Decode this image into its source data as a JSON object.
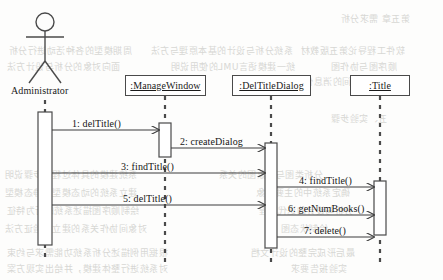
{
  "diagram": {
    "kind": "uml-sequence-diagram",
    "width": 443,
    "height": 280,
    "line_color": "#4a4a4a",
    "text_color": "#1a1a1a",
    "background": "#fdfdfc"
  },
  "actor": {
    "name": "Administrator",
    "icon": "stick-figure-actor",
    "x": 45,
    "head_cy": 22,
    "head_r": 9,
    "lifeline_top": 100,
    "lifeline_bottom": 262,
    "activation": {
      "x": 38,
      "y": 112,
      "w": 14,
      "h": 133
    }
  },
  "lifelines": [
    {
      "id": "managewindow",
      "label": ":ManageWindow",
      "box": {
        "x": 125,
        "y": 75,
        "w": 81,
        "h": 21
      },
      "center_x": 165,
      "lifeline_top": 96,
      "lifeline_bottom": 262,
      "activations": [
        {
          "x": 159,
          "y": 123,
          "w": 12,
          "h": 34
        }
      ]
    },
    {
      "id": "deltitledialog",
      "label": ":DelTitleDialog",
      "box": {
        "x": 232,
        "y": 75,
        "w": 79,
        "h": 21
      },
      "center_x": 271,
      "lifeline_top": 96,
      "lifeline_bottom": 262,
      "activations": [
        {
          "x": 265,
          "y": 143,
          "w": 12,
          "h": 105
        }
      ]
    },
    {
      "id": "title",
      "label": ":Title",
      "box": {
        "x": 350,
        "y": 75,
        "w": 60,
        "h": 21
      },
      "center_x": 380,
      "lifeline_top": 96,
      "lifeline_bottom": 262,
      "activations": [
        {
          "x": 374,
          "y": 181,
          "w": 12,
          "h": 54
        }
      ]
    }
  ],
  "messages": [
    {
      "seq": "1",
      "label": "1: delTitle()",
      "from": "actor",
      "to": "managewindow",
      "x1": 52,
      "x2": 159,
      "y": 130,
      "label_x": 72,
      "label_y": 118,
      "arrow": "solid-open"
    },
    {
      "seq": "2",
      "label": "2: createDialog",
      "from": "managewindow",
      "to": "deltitledialog",
      "x1": 171,
      "x2": 265,
      "y": 148,
      "label_x": 180,
      "label_y": 136,
      "arrow": "solid-open"
    },
    {
      "seq": "3",
      "label": "3: findTitle()",
      "from": "actor",
      "to": "deltitledialog",
      "x1": 52,
      "x2": 265,
      "y": 173,
      "label_x": 121,
      "label_y": 161,
      "arrow": "solid-open"
    },
    {
      "seq": "4",
      "label": "4: findTitle()",
      "from": "deltitledialog",
      "to": "title",
      "x1": 277,
      "x2": 374,
      "y": 187,
      "label_x": 299,
      "label_y": 175,
      "arrow": "solid-open"
    },
    {
      "seq": "5",
      "label": "5: delTitle()",
      "from": "actor",
      "to": "deltitledialog",
      "x1": 52,
      "x2": 265,
      "y": 205,
      "label_x": 123,
      "label_y": 193,
      "arrow": "solid-open"
    },
    {
      "seq": "6",
      "label": "6: getNumBooks()",
      "from": "deltitledialog",
      "to": "title",
      "x1": 277,
      "x2": 374,
      "y": 215,
      "label_x": 288,
      "label_y": 203,
      "arrow": "solid-open"
    },
    {
      "seq": "7",
      "label": "7: delete()",
      "from": "deltitledialog",
      "to": "title",
      "x1": 277,
      "x2": 374,
      "y": 237,
      "label_x": 304,
      "label_y": 225,
      "arrow": "solid-open"
    }
  ],
  "bleed_text": [
    {
      "text": "周期模型的各种活动进行分析",
      "x": 8,
      "y": 44,
      "size": 9
    },
    {
      "text": "系统分析与设计的基本原理与方法",
      "x": 150,
      "y": 44,
      "size": 9
    },
    {
      "text": "软件工程导论第五版教材",
      "x": 300,
      "y": 44,
      "size": 9
    },
    {
      "text": "面向对象的分析与设计方法",
      "x": 6,
      "y": 60,
      "size": 9
    },
    {
      "text": "统一建模语言UML的使用说明",
      "x": 170,
      "y": 60,
      "size": 9
    },
    {
      "text": "顺序图与协作图",
      "x": 330,
      "y": 60,
      "size": 9
    },
    {
      "text": "对象之间的消息传递关系",
      "x": 275,
      "y": 75,
      "size": 9
    },
    {
      "text": "第五章 需求分析",
      "x": 340,
      "y": 12,
      "size": 9
    },
    {
      "text": "五、实验步骤",
      "x": 330,
      "y": 112,
      "size": 9
    },
    {
      "text": "系统建模的具体过程与步骤说明",
      "x": 4,
      "y": 168,
      "size": 9
    },
    {
      "text": "分析类图与对象图的关系",
      "x": 218,
      "y": 168,
      "size": 9
    },
    {
      "text": "建立系统的动态模型和静态模型",
      "x": 4,
      "y": 186,
      "size": 9
    },
    {
      "text": "确定系统中的主要对象",
      "x": 255,
      "y": 186,
      "size": 9
    },
    {
      "text": "绘制顺序图描述系统的行为特征",
      "x": 6,
      "y": 204,
      "size": 9
    },
    {
      "text": "分析与设计的迭代过程",
      "x": 258,
      "y": 204,
      "size": 9
    },
    {
      "text": "对象间协作关系的建立与验证方法",
      "x": 4,
      "y": 222,
      "size": 9
    },
    {
      "text": "绘制状态图",
      "x": 280,
      "y": 222,
      "size": 9
    },
    {
      "text": "根据用例描述分析系统功能需求与约束",
      "x": 6,
      "y": 246,
      "size": 9
    },
    {
      "text": "最后形成完整的设计文档",
      "x": 250,
      "y": 246,
      "size": 9
    },
    {
      "text": "对系统进行整体建模，并给出实现方案",
      "x": 6,
      "y": 262,
      "size": 9
    },
    {
      "text": "实验报告要求",
      "x": 290,
      "y": 262,
      "size": 9
    }
  ]
}
